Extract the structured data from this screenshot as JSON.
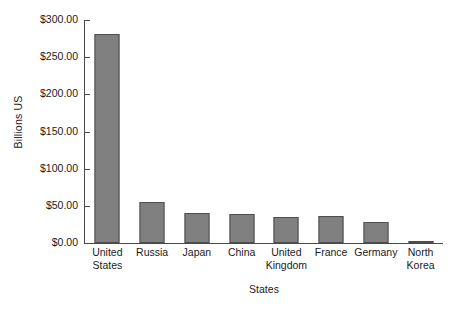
{
  "chart_data": {
    "type": "bar",
    "title": "",
    "xlabel": "States",
    "ylabel": "Billions US",
    "categories": [
      "United States",
      "Russia",
      "Japan",
      "China",
      "United Kingdom",
      "France",
      "Germany",
      "North Korea"
    ],
    "values": [
      281,
      55,
      40,
      39,
      35,
      36,
      28,
      2
    ],
    "ylim": [
      0,
      300
    ],
    "ytick_values": [
      0,
      50,
      100,
      150,
      200,
      250,
      300
    ],
    "ytick_labels": [
      "$0.00",
      "$50.00",
      "$100.00",
      "$150.00",
      "$200.00",
      "$250.00",
      "$300.00"
    ],
    "grid": false,
    "legend": false,
    "bar_color": "#808080",
    "bar_edge_color": "#4d4d4d",
    "axis_color": "#4a4a4a",
    "background_color": "#ffffff"
  },
  "axes": {
    "y_title": "Billions US",
    "x_title": "States"
  }
}
